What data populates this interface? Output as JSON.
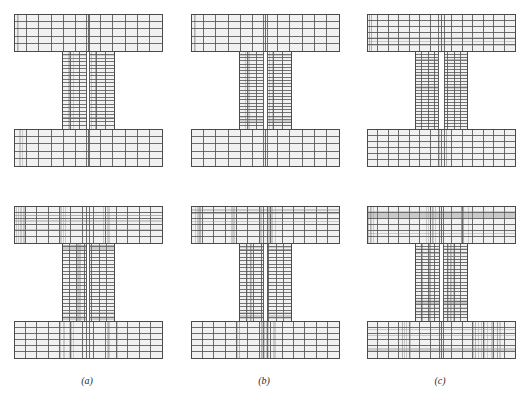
{
  "figure": {
    "type": "finite-element-mesh-grid",
    "rows": 2,
    "columns": 3,
    "background_color": "#ffffff",
    "element_fill_color": "#f1f1f1",
    "mesh_line_color": "#8a8a8a",
    "mesh_line_color_dark": "#555555",
    "outline_color": "#4a4a4a",
    "caption_color": "#2b2b2b"
  },
  "captions": [
    {
      "id": "a",
      "label": "(a)"
    },
    {
      "id": "b",
      "label": "(b)"
    },
    {
      "id": "c",
      "label": "(c)"
    }
  ],
  "geometry": {
    "flange_width": 148,
    "flange_height": 37,
    "web_width": 52,
    "web_height": 78,
    "total_height": 152,
    "note": "I-section: top flange, central web split by vertical interface, bottom flange"
  },
  "panels": [
    {
      "id": "top-a",
      "row": "top",
      "column": "a",
      "x": 13,
      "y": 13,
      "refinement_level": 1,
      "base_cols_flange": 12,
      "base_rows_flange": 5,
      "base_cols_web": 6,
      "base_rows_web": 22,
      "web_slot": 3,
      "refine_clusters": [
        {
          "region": "top-flange",
          "axis": "x",
          "center": 0.04,
          "spread": 0.02,
          "count": 3
        },
        {
          "region": "web",
          "axis": "x",
          "center": 0.18,
          "spread": 0.06,
          "count": 4
        },
        {
          "region": "web",
          "axis": "x",
          "center": 0.62,
          "spread": 0.05,
          "count": 3
        },
        {
          "region": "web",
          "axis": "y",
          "center": 0.1,
          "spread": 0.05,
          "count": 3
        },
        {
          "region": "web",
          "axis": "y",
          "center": 0.82,
          "spread": 0.06,
          "count": 4
        },
        {
          "region": "bottom-flange",
          "axis": "x",
          "center": 0.05,
          "spread": 0.02,
          "count": 3
        }
      ]
    },
    {
      "id": "top-b",
      "row": "top",
      "column": "b",
      "x": 190,
      "y": 13,
      "refinement_level": 1,
      "base_cols_flange": 12,
      "base_rows_flange": 5,
      "base_cols_web": 6,
      "base_rows_web": 24,
      "web_slot": 4,
      "refine_clusters": [
        {
          "region": "top-flange",
          "axis": "x",
          "center": 0.03,
          "spread": 0.02,
          "count": 3
        },
        {
          "region": "web",
          "axis": "x",
          "center": 0.16,
          "spread": 0.05,
          "count": 3
        },
        {
          "region": "web",
          "axis": "x",
          "center": 0.6,
          "spread": 0.05,
          "count": 3
        },
        {
          "region": "web",
          "axis": "y",
          "center": 0.08,
          "spread": 0.05,
          "count": 3
        },
        {
          "region": "web",
          "axis": "y",
          "center": 0.88,
          "spread": 0.05,
          "count": 4
        }
      ]
    },
    {
      "id": "top-c",
      "row": "top",
      "column": "c",
      "x": 366,
      "y": 13,
      "refinement_level": 2,
      "base_cols_flange": 14,
      "base_rows_flange": 6,
      "base_cols_web": 8,
      "base_rows_web": 26,
      "web_slot": 6,
      "refine_clusters": [
        {
          "region": "top-flange",
          "axis": "x",
          "center": 0.02,
          "spread": 0.015,
          "count": 4
        },
        {
          "region": "top-flange",
          "axis": "y",
          "center": 0.75,
          "spread": 0.12,
          "count": 3
        },
        {
          "region": "web",
          "axis": "x",
          "center": 0.5,
          "spread": 0.04,
          "count": 5
        },
        {
          "region": "web",
          "axis": "y",
          "center": 0.5,
          "spread": 0.4,
          "count": 8
        },
        {
          "region": "bottom-flange",
          "axis": "x",
          "center": 0.5,
          "spread": 0.04,
          "count": 4
        }
      ]
    },
    {
      "id": "bottom-a",
      "row": "bottom",
      "column": "a",
      "x": 13,
      "y": 205,
      "refinement_level": 3,
      "base_cols_flange": 13,
      "base_rows_flange": 6,
      "base_cols_web": 7,
      "base_rows_web": 22,
      "web_slot": 3,
      "refine_clusters": [
        {
          "region": "top-flange",
          "axis": "x",
          "center": 0.04,
          "spread": 0.03,
          "count": 6
        },
        {
          "region": "top-flange",
          "axis": "y",
          "center": 0.45,
          "spread": 0.3,
          "count": 5
        },
        {
          "region": "top-flange",
          "axis": "x",
          "center": 0.33,
          "spread": 0.03,
          "count": 4
        },
        {
          "region": "top-flange",
          "axis": "x",
          "center": 0.63,
          "spread": 0.03,
          "count": 4
        },
        {
          "region": "web",
          "axis": "y",
          "center": 0.05,
          "spread": 0.05,
          "count": 5
        },
        {
          "region": "web",
          "axis": "y",
          "center": 0.92,
          "spread": 0.06,
          "count": 6
        },
        {
          "region": "web",
          "axis": "x",
          "center": 0.3,
          "spread": 0.08,
          "count": 4
        },
        {
          "region": "bottom-flange",
          "axis": "x",
          "center": 0.36,
          "spread": 0.05,
          "count": 6
        },
        {
          "region": "bottom-flange",
          "axis": "x",
          "center": 0.66,
          "spread": 0.04,
          "count": 6
        }
      ]
    },
    {
      "id": "bottom-b",
      "row": "bottom",
      "column": "b",
      "x": 190,
      "y": 205,
      "refinement_level": 4,
      "base_cols_flange": 13,
      "base_rows_flange": 6,
      "base_cols_web": 7,
      "base_rows_web": 22,
      "web_slot": 4,
      "refine_clusters": [
        {
          "region": "top-flange",
          "axis": "x",
          "center": 0.04,
          "spread": 0.03,
          "count": 7
        },
        {
          "region": "top-flange",
          "axis": "y",
          "center": 0.4,
          "spread": 0.32,
          "count": 6
        },
        {
          "region": "top-flange",
          "axis": "x",
          "center": 0.3,
          "spread": 0.03,
          "count": 5
        },
        {
          "region": "top-flange",
          "axis": "x",
          "center": 0.52,
          "spread": 0.06,
          "count": 8
        },
        {
          "region": "web",
          "axis": "y",
          "center": 0.04,
          "spread": 0.05,
          "count": 6
        },
        {
          "region": "web",
          "axis": "y",
          "center": 0.93,
          "spread": 0.05,
          "count": 6
        },
        {
          "region": "web",
          "axis": "x",
          "center": 0.18,
          "spread": 0.07,
          "count": 5
        },
        {
          "region": "bottom-flange",
          "axis": "x",
          "center": 0.52,
          "spread": 0.05,
          "count": 10
        },
        {
          "region": "bottom-flange",
          "axis": "x",
          "center": 0.3,
          "spread": 0.03,
          "count": 4
        }
      ]
    },
    {
      "id": "bottom-c",
      "row": "bottom",
      "column": "c",
      "x": 366,
      "y": 205,
      "refinement_level": 5,
      "base_cols_flange": 14,
      "base_rows_flange": 6,
      "base_cols_web": 8,
      "base_rows_web": 24,
      "web_slot": 4,
      "refine_clusters": [
        {
          "region": "top-flange",
          "axis": "x",
          "center": 0.05,
          "spread": 0.04,
          "count": 8
        },
        {
          "region": "top-flange",
          "axis": "y",
          "center": 0.42,
          "spread": 0.32,
          "count": 7
        },
        {
          "region": "top-flange",
          "axis": "x",
          "center": 0.42,
          "spread": 0.05,
          "count": 6
        },
        {
          "region": "top-flange",
          "axis": "x",
          "center": 0.66,
          "spread": 0.04,
          "count": 6
        },
        {
          "region": "web",
          "axis": "y",
          "center": 0.18,
          "spread": 0.12,
          "count": 8
        },
        {
          "region": "web",
          "axis": "y",
          "center": 0.82,
          "spread": 0.1,
          "count": 8
        },
        {
          "region": "web",
          "axis": "x",
          "center": 0.22,
          "spread": 0.08,
          "count": 6
        },
        {
          "region": "web",
          "axis": "x",
          "center": 0.7,
          "spread": 0.07,
          "count": 6
        },
        {
          "region": "bottom-flange",
          "axis": "x",
          "center": 0.28,
          "spread": 0.05,
          "count": 7
        },
        {
          "region": "bottom-flange",
          "axis": "x",
          "center": 0.82,
          "spread": 0.1,
          "count": 14
        },
        {
          "region": "bottom-flange",
          "axis": "y",
          "center": 0.5,
          "spread": 0.35,
          "count": 5
        }
      ]
    }
  ],
  "caption_positions": [
    {
      "id": "a",
      "x": 57,
      "y": 375
    },
    {
      "id": "b",
      "x": 234,
      "y": 375
    },
    {
      "id": "c",
      "x": 410,
      "y": 375
    }
  ]
}
